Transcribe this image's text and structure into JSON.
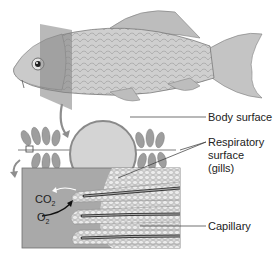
{
  "diagram": {
    "labels": {
      "body_surface": "Body surface",
      "respiratory_line1": "Respiratory",
      "respiratory_line2": "surface",
      "respiratory_line3": "(gills)",
      "capillary": "Capillary",
      "co2": "CO",
      "co2_sub": "2",
      "o2": "O",
      "o2_sub": "2"
    },
    "colors": {
      "background": "#ffffff",
      "fish_body": "#c9c9c9",
      "plane": "#8a8a8a",
      "circle_fill": "#d2d2d2",
      "tissue_box": "#a8a8a8",
      "cells": "#e0e0e0",
      "capillary": "#3a3a3a",
      "text": "#222222"
    }
  }
}
